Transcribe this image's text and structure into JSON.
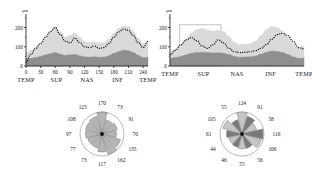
{
  "figure": {
    "panels": [
      {
        "id": "left-line-chart",
        "yaxis": {
          "unit": "µm",
          "ticks": [
            "0",
            "100",
            "200"
          ],
          "min": 0,
          "max": 250
        },
        "xaxis": {
          "ticks": [
            "0",
            "30",
            "60",
            "90",
            "120",
            "150",
            "180",
            "210",
            "240"
          ]
        },
        "regions": [
          "TEMP",
          "SUP",
          "NAS",
          "INF",
          "TEMP"
        ],
        "has_highlight_box": false
      },
      {
        "id": "right-line-chart",
        "yaxis": {
          "unit": "µm",
          "ticks": [
            "0",
            "100",
            "200"
          ],
          "min": 0,
          "max": 250
        },
        "xaxis": {
          "ticks": []
        },
        "regions": [
          "TEMP",
          "SUP",
          "NAS",
          "INF",
          "TEMP"
        ],
        "has_highlight_box": true
      }
    ],
    "pies": [
      {
        "id": "left-pie-chart",
        "values": [
          170,
          73,
          91,
          70,
          135,
          162,
          117,
          73,
          77,
          97,
          108,
          123
        ],
        "shading": "uniform",
        "colors": {
          "sector": "#b5b5b5",
          "alt_sector": "#b5b5b5",
          "hub": "#111111"
        }
      },
      {
        "id": "right-pie-chart",
        "values": [
          124,
          91,
          58,
          116,
          106,
          56,
          55,
          46,
          44,
          61,
          105,
          55
        ],
        "shading": "alternating",
        "colors": {
          "sector": "#c6c6c6",
          "alt_sector": "#7a7a7a",
          "hub": "#111111"
        }
      }
    ],
    "colors": {
      "band_outer": "#d9d9d9",
      "band_inner": "#8f8f8f",
      "dotted_line": "#1a1a1a",
      "axis": "#1a1a1a",
      "highlight_box": "#c9c9c9"
    }
  },
  "chart_data": [
    {
      "type": "area",
      "id": "left-line-chart",
      "title": "",
      "xlabel": "",
      "ylabel": "µm",
      "xlim": [
        0,
        250
      ],
      "ylim": [
        0,
        250
      ],
      "xticks": [
        0,
        30,
        60,
        90,
        120,
        150,
        180,
        210,
        240
      ],
      "xtick_labels": [
        "0",
        "30",
        "60",
        "90",
        "120",
        "150",
        "180",
        "210",
        "240"
      ],
      "yticks": [
        0,
        100,
        200
      ],
      "ytick_labels": [
        "0",
        "100",
        "200"
      ],
      "region_labels": [
        "TEMP",
        "SUP",
        "NAS",
        "INF",
        "TEMP"
      ],
      "grid": false,
      "legend": "none",
      "x": [
        0,
        10,
        20,
        30,
        40,
        50,
        60,
        70,
        80,
        90,
        100,
        110,
        120,
        130,
        140,
        150,
        160,
        170,
        180,
        190,
        200,
        210,
        220,
        230,
        240,
        250
      ],
      "series": [
        {
          "name": "outer band (light gray)",
          "values": [
            70,
            82,
            98,
            118,
            150,
            178,
            205,
            178,
            150,
            160,
            172,
            150,
            128,
            122,
            126,
            120,
            122,
            140,
            170,
            196,
            208,
            205,
            180,
            146,
            116,
            122
          ]
        },
        {
          "name": "inner band (dark gray)",
          "values": [
            38,
            40,
            44,
            50,
            58,
            64,
            70,
            62,
            55,
            58,
            60,
            54,
            48,
            46,
            48,
            46,
            47,
            54,
            66,
            76,
            82,
            80,
            70,
            56,
            44,
            46
          ]
        },
        {
          "name": "subject profile (dotted)",
          "values": [
            20,
            60,
            92,
            118,
            150,
            180,
            200,
            165,
            130,
            120,
            145,
            122,
            100,
            96,
            104,
            92,
            96,
            118,
            150,
            178,
            192,
            186,
            158,
            122,
            96,
            128
          ]
        }
      ]
    },
    {
      "type": "area",
      "id": "right-line-chart",
      "title": "",
      "xlabel": "",
      "ylabel": "µm",
      "xlim": [
        0,
        250
      ],
      "ylim": [
        0,
        250
      ],
      "xticks": [],
      "xtick_labels": [],
      "yticks": [
        0,
        100,
        200
      ],
      "ytick_labels": [
        "0",
        "100",
        "200"
      ],
      "region_labels": [
        "TEMP",
        "SUP",
        "NAS",
        "INF",
        "TEMP"
      ],
      "grid": false,
      "legend": "none",
      "highlight_box": {
        "x0": 18,
        "x1": 95,
        "y0": 0,
        "y1": 215
      },
      "x": [
        0,
        10,
        20,
        30,
        40,
        50,
        60,
        70,
        80,
        90,
        100,
        110,
        120,
        130,
        140,
        150,
        160,
        170,
        180,
        190,
        200,
        210,
        220,
        230,
        240,
        250
      ],
      "series": [
        {
          "name": "outer band (light gray)",
          "values": [
            72,
            88,
            110,
            140,
            172,
            190,
            196,
            188,
            182,
            186,
            180,
            156,
            124,
            112,
            114,
            116,
            130,
            160,
            192,
            206,
            200,
            182,
            152,
            118,
            96,
            104
          ]
        },
        {
          "name": "inner band (dark gray)",
          "values": [
            40,
            44,
            50,
            58,
            66,
            70,
            72,
            70,
            68,
            69,
            67,
            60,
            50,
            46,
            47,
            48,
            52,
            62,
            72,
            78,
            76,
            70,
            60,
            48,
            40,
            42
          ]
        },
        {
          "name": "subject profile (dotted)",
          "values": [
            58,
            82,
            110,
            136,
            148,
            132,
            104,
            92,
            110,
            136,
            120,
            92,
            74,
            70,
            72,
            74,
            80,
            92,
            112,
            140,
            164,
            170,
            158,
            128,
            96,
            90
          ]
        }
      ]
    },
    {
      "type": "pie",
      "id": "left-pie-chart",
      "title": "",
      "labels": [
        "170",
        "73",
        "91",
        "70",
        "135",
        "162",
        "117",
        "73",
        "77",
        "97",
        "108",
        "123"
      ],
      "values": [
        170,
        73,
        91,
        70,
        135,
        162,
        117,
        73,
        77,
        97,
        108,
        123
      ],
      "note": "12 equal-angle sectors; radius encodes value; labels placed around rim"
    },
    {
      "type": "pie",
      "id": "right-pie-chart",
      "title": "",
      "labels": [
        "124",
        "91",
        "58",
        "116",
        "106",
        "56",
        "55",
        "46",
        "44",
        "61",
        "105",
        "55"
      ],
      "values": [
        124,
        91,
        58,
        116,
        106,
        56,
        55,
        46,
        44,
        61,
        105,
        55
      ],
      "note": "12 equal-angle sectors, alternating light/dark fill; radius encodes value"
    }
  ]
}
